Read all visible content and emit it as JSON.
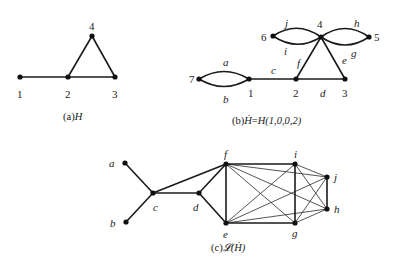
{
  "figures": {
    "a": {
      "caption_prefix": "(a)",
      "caption_name": "H",
      "nodes": [
        {
          "id": "1",
          "label": "1"
        },
        {
          "id": "2",
          "label": "2"
        },
        {
          "id": "3",
          "label": "3"
        },
        {
          "id": "4",
          "label": "4"
        }
      ],
      "edges": [
        [
          "1",
          "2"
        ],
        [
          "2",
          "3"
        ],
        [
          "2",
          "4"
        ],
        [
          "3",
          "4"
        ]
      ]
    },
    "b": {
      "caption_prefix": "(b)",
      "caption_name": "Ḣ",
      "caption_equals": "=",
      "caption_rhs": "H(1,0,0,2)",
      "nodes": [
        {
          "id": "1",
          "label": "1"
        },
        {
          "id": "2",
          "label": "2"
        },
        {
          "id": "3",
          "label": "3"
        },
        {
          "id": "4",
          "label": "4"
        },
        {
          "id": "5",
          "label": "5"
        },
        {
          "id": "6",
          "label": "6"
        },
        {
          "id": "7",
          "label": "7"
        }
      ],
      "edge_labels": {
        "a": "a",
        "b": "b",
        "c": "c",
        "d": "d",
        "e": "e",
        "f": "f",
        "g": "g",
        "h": "h",
        "i": "i",
        "j": "j"
      },
      "edges": [
        {
          "label": "a",
          "from": "7",
          "to": "1",
          "curve": "upper"
        },
        {
          "label": "b",
          "from": "7",
          "to": "1",
          "curve": "lower"
        },
        {
          "label": "c",
          "from": "1",
          "to": "2"
        },
        {
          "label": "d",
          "from": "2",
          "to": "3"
        },
        {
          "label": "e",
          "from": "3",
          "to": "4"
        },
        {
          "label": "f",
          "from": "2",
          "to": "4"
        },
        {
          "label": "j",
          "from": "6",
          "to": "4",
          "curve": "upper"
        },
        {
          "label": "i",
          "from": "6",
          "to": "4",
          "curve": "lower"
        },
        {
          "label": "h",
          "from": "4",
          "to": "5",
          "curve": "upper"
        },
        {
          "label": "g",
          "from": "4",
          "to": "5",
          "curve": "lower"
        }
      ]
    },
    "c": {
      "caption_prefix": "(c)",
      "caption_name": "𝓛(Ḣ)",
      "nodes": [
        {
          "id": "a",
          "label": "a"
        },
        {
          "id": "b",
          "label": "b"
        },
        {
          "id": "c",
          "label": "c"
        },
        {
          "id": "d",
          "label": "d"
        },
        {
          "id": "e",
          "label": "e"
        },
        {
          "id": "f",
          "label": "f"
        },
        {
          "id": "g",
          "label": "g"
        },
        {
          "id": "h",
          "label": "h"
        },
        {
          "id": "i",
          "label": "i"
        },
        {
          "id": "j",
          "label": "j"
        }
      ],
      "thick_edges": [
        [
          "a",
          "c"
        ],
        [
          "b",
          "c"
        ],
        [
          "c",
          "d"
        ],
        [
          "c",
          "f"
        ],
        [
          "d",
          "f"
        ],
        [
          "d",
          "e"
        ],
        [
          "e",
          "f"
        ],
        [
          "f",
          "i"
        ],
        [
          "e",
          "g"
        ],
        [
          "i",
          "g"
        ],
        [
          "j",
          "h"
        ]
      ],
      "thin_edges": [
        [
          "f",
          "g"
        ],
        [
          "f",
          "j"
        ],
        [
          "f",
          "h"
        ],
        [
          "e",
          "i"
        ],
        [
          "e",
          "j"
        ],
        [
          "e",
          "h"
        ],
        [
          "i",
          "j"
        ],
        [
          "i",
          "h"
        ],
        [
          "g",
          "j"
        ],
        [
          "g",
          "h"
        ]
      ]
    }
  }
}
